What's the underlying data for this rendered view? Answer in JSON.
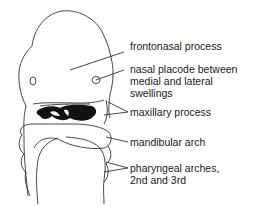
{
  "diagram": {
    "labels": [
      {
        "id": "frontonasal",
        "text": "frontonasal process"
      },
      {
        "id": "nasal",
        "text": "nasal placode between\nmedial and lateral\nswellings"
      },
      {
        "id": "maxillary",
        "text": "maxillary process"
      },
      {
        "id": "mandibular",
        "text": "mandibular arch"
      },
      {
        "id": "pharyngeal",
        "text": "pharyngeal arches,\n2nd and 3rd"
      }
    ],
    "colors": {
      "line": "#1a1a1a",
      "background": "#ffffff"
    }
  }
}
